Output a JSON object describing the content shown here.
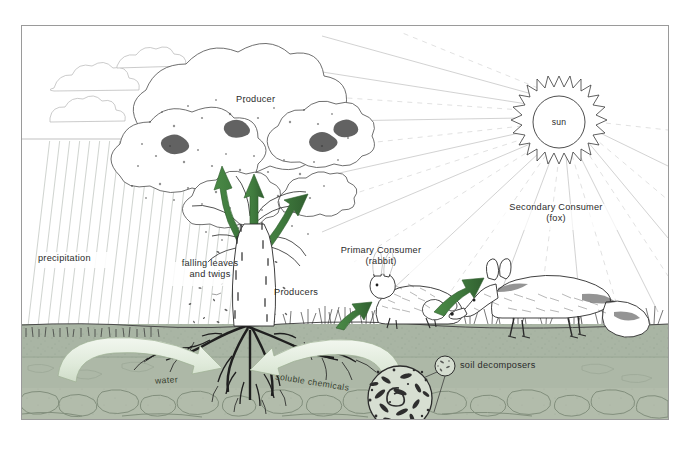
{
  "diagram": {
    "labels": {
      "producer": "Producer",
      "producers": "Producers",
      "precipitation": "precipitation",
      "falling_leaves_line1": "falling leaves",
      "falling_leaves_line2": "and twigs",
      "primary_consumer_line1": "Primary Consumer",
      "primary_consumer_line2": "(rabbit)",
      "secondary_consumer_line1": "Secondary Consumer",
      "secondary_consumer_line2": "(fox)",
      "sun": "sun",
      "soil_decomposers": "soil decomposers",
      "water": "water",
      "soluble_chemicals": "soluble chemicals"
    },
    "colors": {
      "arrow_green": "#3f7a3d",
      "arrow_green_dark": "#2f5e2e",
      "pale_green_arrow": "#dfeada",
      "soil_topsoil": "#a9b5a4",
      "soil_subsoil": "#adb7a6",
      "bedrock": "#b0bbaa",
      "ink": "#2b2b2b",
      "frame": "#9a9a9a",
      "ray_light": "#cfcfcf",
      "sky": "#ffffff"
    },
    "elements": {
      "sun_rays_solid": 11,
      "sun_rays_dashed": 10,
      "energy_arrows": 3,
      "nutrient_arrows": 2,
      "soil_layers": 3
    }
  }
}
